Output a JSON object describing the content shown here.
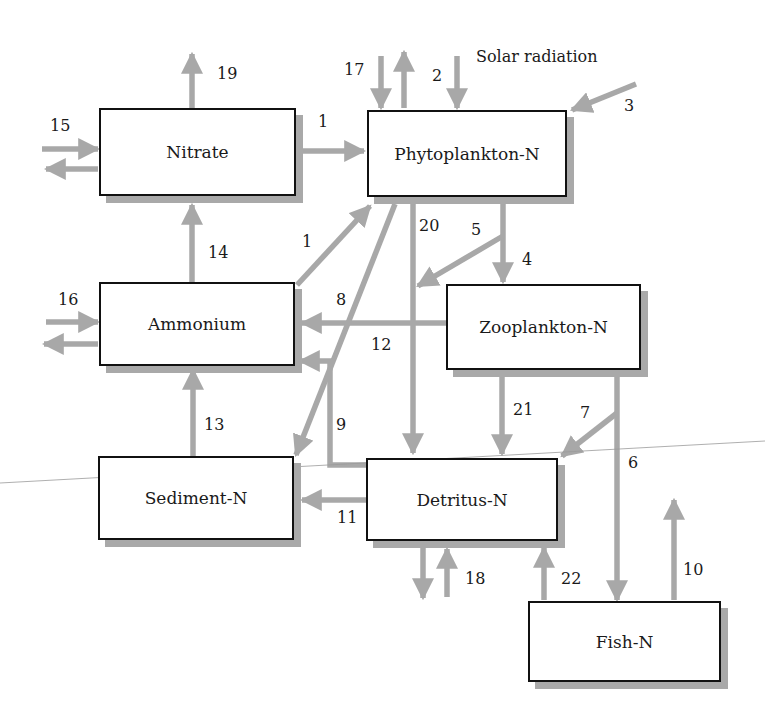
{
  "colors": {
    "arrow": "#a8a8a8",
    "box_border": "#111111",
    "shadow": "#a9a9a9"
  },
  "compartments": {
    "nitrate": "Nitrate",
    "phytoplankton": "Phytoplankton-N",
    "ammonium": "Ammonium",
    "zooplankton": "Zooplankton-N",
    "sediment": "Sediment-N",
    "detritus": "Detritus-N",
    "fish": "Fish-N"
  },
  "annotations": {
    "solar": "Solar radiation"
  },
  "flows": [
    {
      "id": "1",
      "from": "Nitrate",
      "to": "Phytoplankton-N"
    },
    {
      "id": "1",
      "from": "Ammonium",
      "to": "Phytoplankton-N"
    },
    {
      "id": "2",
      "from": "Solar radiation",
      "to": "Phytoplankton-N"
    },
    {
      "id": "3",
      "from": "External",
      "to": "Phytoplankton-N"
    },
    {
      "id": "4",
      "from": "Phytoplankton-N",
      "to": "Zooplankton-N"
    },
    {
      "id": "5",
      "from": "Phytoplankton-N/Zooplankton grazing",
      "to": "Detritus-N"
    },
    {
      "id": "6",
      "from": "Zooplankton-N",
      "to": "Fish-N"
    },
    {
      "id": "7",
      "from": "Zooplankton/Fish branch",
      "to": "Detritus-N"
    },
    {
      "id": "8",
      "from": "Phytoplankton-N",
      "to": "Sediment-N"
    },
    {
      "id": "9",
      "from": "Detritus-N",
      "to": "Ammonium"
    },
    {
      "id": "10",
      "from": "Fish-N",
      "to": "Out"
    },
    {
      "id": "11",
      "from": "Detritus-N",
      "to": "Sediment-N"
    },
    {
      "id": "12",
      "from": "Zooplankton-N",
      "to": "Ammonium"
    },
    {
      "id": "13",
      "from": "Sediment-N",
      "to": "Ammonium"
    },
    {
      "id": "14",
      "from": "Ammonium",
      "to": "Nitrate"
    },
    {
      "id": "15",
      "from": "External",
      "to": "Nitrate (exchange)"
    },
    {
      "id": "16",
      "from": "External",
      "to": "Ammonium (exchange)"
    },
    {
      "id": "17",
      "from": "External",
      "to": "Phytoplankton-N (exchange)"
    },
    {
      "id": "18",
      "from": "External",
      "to": "Detritus-N (exchange)"
    },
    {
      "id": "19",
      "from": "Nitrate",
      "to": "Out"
    },
    {
      "id": "20",
      "from": "Phytoplankton-N",
      "to": "Detritus-N"
    },
    {
      "id": "21",
      "from": "Zooplankton-N",
      "to": "Detritus-N"
    },
    {
      "id": "22",
      "from": "Fish-N",
      "to": "Detritus-N"
    }
  ],
  "labels": {
    "l1a": "1",
    "l1b": "1",
    "l2": "2",
    "l3": "3",
    "l4": "4",
    "l5": "5",
    "l6": "6",
    "l7": "7",
    "l8": "8",
    "l9": "9",
    "l10": "10",
    "l11": "11",
    "l12": "12",
    "l13": "13",
    "l14": "14",
    "l15": "15",
    "l16": "16",
    "l17": "17",
    "l18": "18",
    "l19": "19",
    "l20": "20",
    "l21": "21",
    "l22": "22"
  }
}
